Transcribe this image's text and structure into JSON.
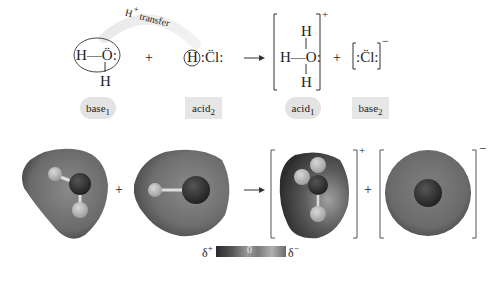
{
  "diagram": {
    "type": "acid-base reaction (proton transfer)",
    "arc_label": {
      "prefix": "H",
      "superscript": "+",
      "suffix": " transfer"
    },
    "top_row": {
      "water": {
        "h_left": "H",
        "bond": "—",
        "o": "Ö",
        "lone": ":",
        "h_bottom": "H"
      },
      "plus1": "+",
      "hcl": {
        "h": "H",
        "cl": ":C̈l:"
      },
      "arrow": "→",
      "hydronium": {
        "h_top": "H",
        "h_left": "H",
        "bond": "—",
        "o": "O:",
        "h_bottom": "H",
        "charge": "+"
      },
      "plus2": "+",
      "chloride": {
        "cl": ":C̈l:",
        "charge": "−"
      }
    },
    "labels": [
      {
        "text": "base",
        "sub": "1",
        "style": "pill"
      },
      {
        "text": "acid",
        "sub": "2",
        "style": "box"
      },
      {
        "text": "acid",
        "sub": "1",
        "style": "pill"
      },
      {
        "text": "base",
        "sub": "2",
        "style": "box"
      }
    ],
    "bottom_row": {
      "plus1": "+",
      "arrow": "→",
      "hydronium_charge": "+",
      "plus2": "+",
      "chloride_charge": "−"
    },
    "color_scale": {
      "left_label": "δ+",
      "middle_label": "0",
      "right_label": "δ−",
      "left_label_base": "δ",
      "left_label_sup": "+",
      "right_label_base": "δ",
      "right_label_sup": "−"
    },
    "colors": {
      "label_bg": "#e3e3e3",
      "arc": "#e8e8e8",
      "text": "#222222"
    }
  }
}
